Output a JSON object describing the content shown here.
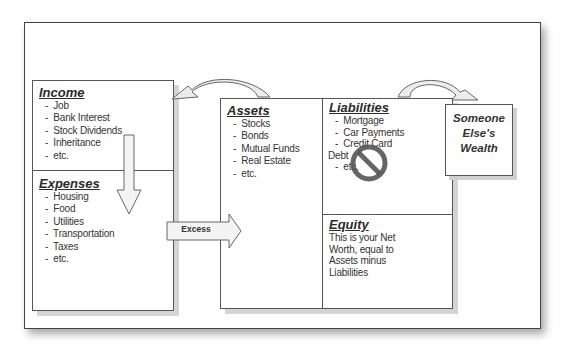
{
  "income": {
    "title": "Income",
    "items": [
      "Job",
      "Bank Interest",
      "Stock Dividends",
      "Inheritance",
      "etc."
    ]
  },
  "expenses": {
    "title": "Expenses",
    "items": [
      "Housing",
      "Food",
      "Utilities",
      "Transportation",
      "Taxes",
      "etc."
    ]
  },
  "assets": {
    "title": "Assets",
    "items": [
      "Stocks",
      "Bonds",
      "Mutual Funds",
      "Real Estate",
      "etc."
    ]
  },
  "liabilities": {
    "title": "Liabilities",
    "items": [
      "Mortgage",
      "Car Payments",
      "Credit Card"
    ],
    "continuation": "Debt",
    "tail_item": "etc."
  },
  "equity": {
    "title": "Equity",
    "description": "This is your Net Worth, equal to Assets minus Liabilities"
  },
  "someone_else": {
    "line1": "Someone",
    "line2": "Else's",
    "line3": "Wealth"
  },
  "arrows": {
    "excess_label": "Excess"
  },
  "colors": {
    "border": "#555555",
    "shadow": "#d4d4d4",
    "arrow_fill": "#f2f2f2",
    "no_sign": "#555555"
  }
}
